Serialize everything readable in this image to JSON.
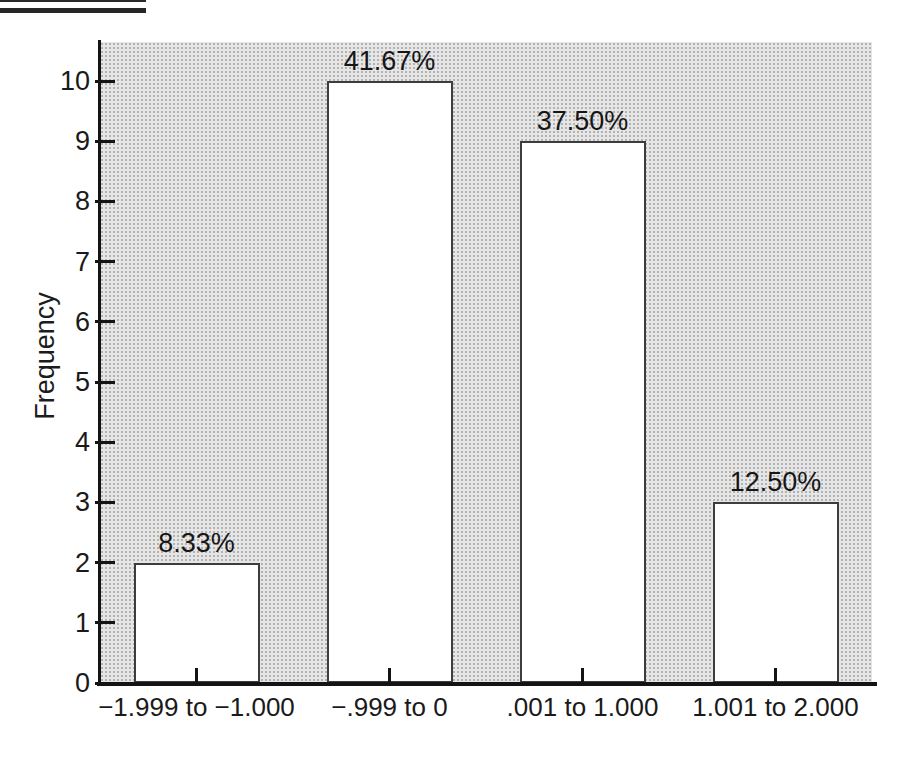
{
  "page": {
    "background": "#ffffff"
  },
  "decor": {
    "corner_rule_color": "#262626"
  },
  "chart_data": {
    "type": "bar",
    "title": "",
    "categories": [
      "−1.999 to −1.000",
      "−.999 to 0",
      ".001 to 1.000",
      "1.001 to 2.000"
    ],
    "values": [
      2,
      10,
      9,
      3
    ],
    "bar_labels": [
      "8.33%",
      "41.67%",
      "37.50%",
      "12.50%"
    ],
    "xlabel": "",
    "ylabel": "Frequency",
    "ylim": [
      0,
      10.7
    ],
    "yticks": [
      "0",
      "1",
      "2",
      "3",
      "4",
      "5",
      "6",
      "7",
      "8",
      "9",
      "10"
    ],
    "grid": false,
    "legend": false,
    "bar_fill": "#ffffff",
    "bar_border": "#3d3d3d",
    "axis_color": "#141414",
    "text_color": "#1a1a1a",
    "plot_background": "stippled-light-gray",
    "plot_bg_color": "#e6e6e6"
  }
}
